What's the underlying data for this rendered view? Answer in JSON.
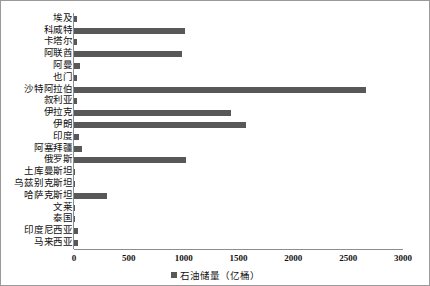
{
  "chart_data": {
    "type": "bar",
    "orientation": "horizontal",
    "title": "",
    "xlabel": "",
    "ylabel": "",
    "xlim": [
      0,
      3000
    ],
    "xticks": [
      0,
      500,
      1000,
      1500,
      2000,
      2500,
      3000
    ],
    "grid": false,
    "legend_position": "bottom-center",
    "series": [
      {
        "name": "石油储量（亿桶）",
        "color": "#585858",
        "values": [
          30,
          1015,
          25,
          985,
          55,
          30,
          2660,
          25,
          1430,
          1570,
          50,
          70,
          1020,
          6,
          6,
          300,
          11,
          4,
          35,
          35
        ]
      }
    ],
    "categories": [
      "埃及",
      "科威特",
      "卡塔尔",
      "阿联酋",
      "阿曼",
      "也门",
      "沙特阿拉伯",
      "叙利亚",
      "伊拉克",
      "伊朗",
      "印度",
      "阿塞拜疆",
      "俄罗斯",
      "土库曼斯坦",
      "乌兹别克斯坦",
      "哈萨克斯坦",
      "文莱",
      "泰国",
      "印度尼西亚",
      "马来西亚"
    ]
  },
  "legend": {
    "label": "石油储量（亿桶）",
    "swatch_color": "#585858"
  },
  "axis": {
    "tick_labels": [
      "0",
      "500",
      "1000",
      "1500",
      "2000",
      "2500",
      "3000"
    ]
  }
}
